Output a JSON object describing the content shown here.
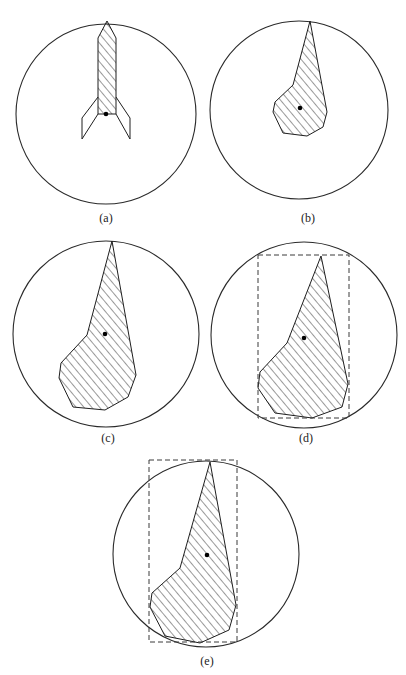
{
  "figure": {
    "hatch": {
      "spacing": 6,
      "angle": -40,
      "color": "#1e1e1e"
    },
    "panels": [
      {
        "id": "a",
        "label": "(a)",
        "label_pos": [
          106,
          222
        ],
        "circle": {
          "cx": 106,
          "cy": 114,
          "r": 90
        },
        "centroid": [
          106,
          114
        ],
        "bbox": null,
        "hatched": [
          [
            107,
            21
          ],
          [
            116,
            38
          ],
          [
            116,
            114
          ],
          [
            98,
            114
          ],
          [
            98,
            38
          ]
        ],
        "outline_extra": [
          [
            [
              98,
              97
            ],
            [
              82,
              118
            ],
            [
              82,
              139
            ],
            [
              98,
              114
            ]
          ],
          [
            [
              116,
              97
            ],
            [
              130,
              118
            ],
            [
              130,
              139
            ],
            [
              116,
              114
            ]
          ]
        ]
      },
      {
        "id": "b",
        "label": "(b)",
        "label_pos": [
          308,
          222
        ],
        "circle": {
          "cx": 299,
          "cy": 110,
          "r": 89
        },
        "centroid": [
          300,
          108
        ],
        "bbox": null,
        "hatched": [
          [
            310,
            21
          ],
          [
            293,
            85
          ],
          [
            275,
            102
          ],
          [
            273,
            112
          ],
          [
            283,
            133
          ],
          [
            307,
            136
          ],
          [
            323,
            127
          ],
          [
            327,
            112
          ]
        ],
        "outline_extra": []
      },
      {
        "id": "c",
        "label": "(c)",
        "label_pos": [
          108,
          442
        ],
        "circle": {
          "cx": 106,
          "cy": 334,
          "r": 93
        },
        "centroid": [
          105,
          334
        ],
        "bbox": null,
        "hatched": [
          [
            112,
            241
          ],
          [
            87,
            335
          ],
          [
            61,
            363
          ],
          [
            59,
            378
          ],
          [
            73,
            407
          ],
          [
            105,
            410
          ],
          [
            128,
            397
          ],
          [
            136,
            375
          ]
        ],
        "outline_extra": []
      },
      {
        "id": "d",
        "label": "(d)",
        "label_pos": [
          306,
          442
        ],
        "circle": {
          "cx": 304,
          "cy": 335,
          "r": 93
        },
        "centroid": [
          304,
          338
        ],
        "bbox": {
          "x": 258,
          "y": 255,
          "w": 91,
          "h": 163
        },
        "hatched": [
          [
            321,
            256
          ],
          [
            287,
            343
          ],
          [
            260,
            372
          ],
          [
            258,
            388
          ],
          [
            275,
            413
          ],
          [
            312,
            418
          ],
          [
            342,
            407
          ],
          [
            348,
            384
          ]
        ],
        "outline_extra": []
      },
      {
        "id": "e",
        "label": "(e)",
        "label_pos": [
          207,
          665
        ],
        "circle": {
          "cx": 206,
          "cy": 554,
          "r": 93
        },
        "centroid": [
          207,
          555
        ],
        "bbox": {
          "x": 149,
          "y": 460,
          "w": 88,
          "h": 182
        },
        "hatched": [
          [
            210,
            462
          ],
          [
            180,
            568
          ],
          [
            152,
            593
          ],
          [
            150,
            607
          ],
          [
            165,
            636
          ],
          [
            200,
            643
          ],
          [
            229,
            630
          ],
          [
            236,
            605
          ]
        ],
        "outline_extra": []
      }
    ]
  }
}
